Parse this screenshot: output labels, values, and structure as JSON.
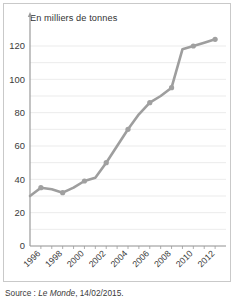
{
  "figure": {
    "title": "En milliers de tonnes",
    "source_prefix": "Source : ",
    "source_publication": "Le Monde",
    "source_suffix": ", 14/02/2015."
  },
  "style": {
    "line_color": "#9e9e9e",
    "marker_color": "#a0a0a0",
    "grid_color": "#e6e6e6",
    "axis_color": "#9a9a9a",
    "border_color": "#c9c9c9",
    "background": "#ffffff",
    "text_color": "#3a3a3a"
  },
  "chart_data": {
    "type": "line",
    "title": "En milliers de tonnes",
    "xlabel": "",
    "ylabel": "En milliers de tonnes",
    "ylim": [
      0,
      130
    ],
    "xlim": [
      1995,
      2013
    ],
    "grid": true,
    "grid_interval": 10,
    "legend": false,
    "ytick_labels": [
      "0",
      "20",
      "40",
      "60",
      "80",
      "100",
      "120"
    ],
    "ytick_values": [
      0,
      20,
      40,
      60,
      80,
      100,
      120
    ],
    "xtick_labels": [
      "1996",
      "1998",
      "2000",
      "2002",
      "2004",
      "2006",
      "2008",
      "2010",
      "2012"
    ],
    "xtick_values": [
      1996,
      1998,
      2000,
      2002,
      2004,
      2006,
      2008,
      2010,
      2012
    ],
    "xtick_rotation": 45,
    "x": [
      1995,
      1996,
      1997,
      1998,
      1999,
      2000,
      2001,
      2002,
      2003,
      2004,
      2005,
      2006,
      2007,
      2008,
      2009,
      2010,
      2011,
      2012
    ],
    "values": [
      30,
      35,
      34,
      32,
      35,
      39,
      41,
      50,
      60,
      70,
      79,
      86,
      90,
      95,
      118,
      120,
      122,
      124
    ],
    "marker_x": [
      1996,
      1998,
      2000,
      2002,
      2004,
      2006,
      2008,
      2010,
      2012
    ],
    "marker_values": [
      35,
      32,
      39,
      50,
      70,
      86,
      95,
      120,
      124
    ]
  }
}
